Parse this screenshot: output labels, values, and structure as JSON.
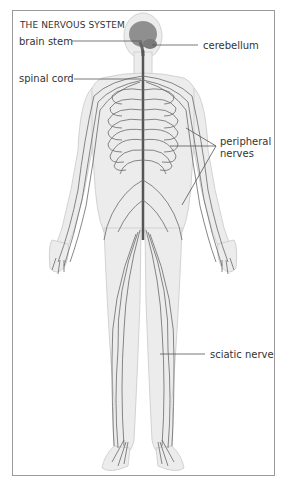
{
  "cropped_header_text": "...nervous system diagram",
  "diagram": {
    "title": "THE NERVOUS SYSTEM",
    "labels": {
      "brain_stem": "brain stem",
      "cerebellum": "cerebellum",
      "spinal_cord": "spinal cord",
      "peripheral_nerves_line1": "peripheral",
      "peripheral_nerves_line2": "nerves",
      "sciatic_nerve": "sciatic nerve"
    },
    "colors": {
      "frame": "#9a9a9a",
      "body_fill": "#ececec",
      "body_outline": "#d0d0d0",
      "brain": "#8a8a8a",
      "nerves": "#555555",
      "leader_lines": "#555555"
    }
  }
}
